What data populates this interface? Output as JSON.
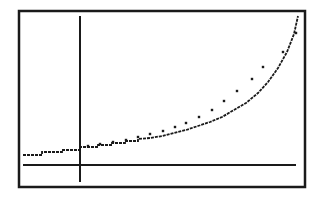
{
  "screen": {
    "description": "Graphing calculator screen: scatter plot with exponential regression curve",
    "frame": {
      "x": 19,
      "y": 11,
      "width": 286,
      "height": 176
    },
    "ink_color": "#1a1a1a",
    "background_color": "#ffffff"
  },
  "axes": {
    "y_axis": {
      "x": 80,
      "y1": 16,
      "y2": 182
    },
    "x_axis": {
      "y": 165,
      "x1": 23,
      "x2": 296
    }
  },
  "chart_data": {
    "type": "scatter",
    "title": "",
    "xlabel": "",
    "ylabel": "",
    "grid": false,
    "legend": null,
    "tick_labels": [],
    "series": [
      {
        "name": "data points",
        "kind": "scatter",
        "points_px": [
          [
            88,
            146
          ],
          [
            100,
            144
          ],
          [
            113,
            142
          ],
          [
            126,
            140
          ],
          [
            138,
            137
          ],
          [
            150,
            134
          ],
          [
            163,
            131
          ],
          [
            175,
            127
          ],
          [
            186,
            123
          ],
          [
            199,
            117
          ],
          [
            212,
            110
          ],
          [
            224,
            101
          ],
          [
            237,
            91
          ],
          [
            252,
            79
          ],
          [
            263,
            67
          ],
          [
            283,
            52
          ],
          [
            296,
            33
          ]
        ]
      },
      {
        "name": "regression curve",
        "kind": "line",
        "style": "stepped pixel line",
        "points_px": [
          [
            23,
            155
          ],
          [
            42,
            155
          ],
          [
            42,
            152
          ],
          [
            62,
            152
          ],
          [
            62,
            150
          ],
          [
            80,
            150
          ],
          [
            80,
            147
          ],
          [
            98,
            147
          ],
          [
            98,
            145
          ],
          [
            112,
            145
          ],
          [
            112,
            143
          ],
          [
            125,
            143
          ],
          [
            125,
            141
          ],
          [
            138,
            141
          ],
          [
            138,
            139
          ],
          [
            150,
            138
          ],
          [
            162,
            136
          ],
          [
            174,
            133
          ],
          [
            186,
            130
          ],
          [
            198,
            126
          ],
          [
            210,
            122
          ],
          [
            222,
            117
          ],
          [
            234,
            110
          ],
          [
            246,
            103
          ],
          [
            258,
            93
          ],
          [
            268,
            82
          ],
          [
            278,
            68
          ],
          [
            287,
            52
          ],
          [
            294,
            34
          ],
          [
            298,
            16
          ]
        ]
      }
    ]
  }
}
